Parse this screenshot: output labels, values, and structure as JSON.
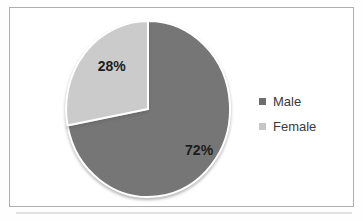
{
  "chart_data": {
    "type": "pie",
    "categories": [
      "Male",
      "Female"
    ],
    "values": [
      72,
      28
    ],
    "labels": [
      "72%",
      "28%"
    ],
    "colors": [
      "#767676",
      "#cbcbcb"
    ],
    "title": "",
    "legend": {
      "position": "right",
      "entries": [
        "Male",
        "Female"
      ],
      "marker_colors": [
        "#6e6e6e",
        "#c6c6c6"
      ]
    },
    "start_angle_deg": 0,
    "direction": "clockwise",
    "slice_outline_color": "#ffffff",
    "label_hints": [
      {
        "angle": 127,
        "r": 0.78
      },
      {
        "angle": 318,
        "r": 0.66
      }
    ]
  },
  "frame": {
    "border_color": "#aeaeae",
    "background": "#ffffff"
  }
}
